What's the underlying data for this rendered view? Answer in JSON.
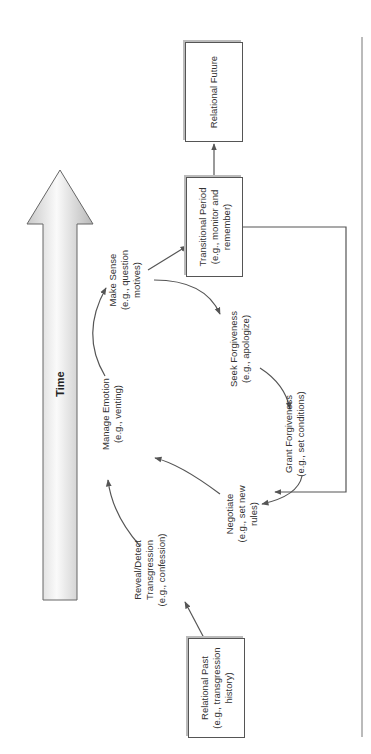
{
  "diagram": {
    "time_axis": {
      "label": "Time"
    },
    "boxes": {
      "relational_past": {
        "title": "Relational Past",
        "example_line1": "(e.g., transgression",
        "example_line2": "history)"
      },
      "transitional_period": {
        "title": "Transitional Period",
        "example_line1": "(e.g., monitor and",
        "example_line2": "remember)"
      },
      "relational_future": {
        "title": "Relational Future"
      }
    },
    "cycle_steps": [
      {
        "title": "Reveal/Detect",
        "line2": "Transgression",
        "example": "(e.g., confession)"
      },
      {
        "title": "Manage Emotion",
        "example": "(e.g., venting)"
      },
      {
        "title": "Make Sense",
        "example_line1": "(e.g., question",
        "example_line2": "motives)"
      },
      {
        "title": "Seek Forgiveness",
        "example": "(e.g., apologize)"
      },
      {
        "title": "Grant Forgiveness",
        "example": "(e.g., set conditions)"
      },
      {
        "title": "Negotiate",
        "example_line1": "(e.g., set new",
        "example_line2": "rules)"
      }
    ],
    "colors": {
      "stroke": "#555555",
      "arrow_fill_light": "#f4f4f4",
      "arrow_fill_dark": "#bdbdbd",
      "separator": "#777777"
    }
  }
}
